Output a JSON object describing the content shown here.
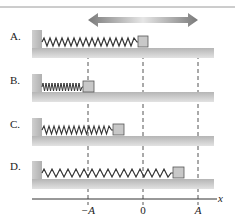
{
  "diagram": {
    "title_arrow": "double-headed-arrow",
    "rows": [
      {
        "label": "A.",
        "block_position": "0",
        "spring_state": "equilibrium"
      },
      {
        "label": "B.",
        "block_position": "-A",
        "spring_state": "compressed"
      },
      {
        "label": "C.",
        "block_position": "-A/2",
        "spring_state": "partially-compressed"
      },
      {
        "label": "D.",
        "block_position": "A/2",
        "spring_state": "stretched"
      }
    ],
    "axis": {
      "label": "x",
      "ticks": [
        "−A",
        "0",
        "A"
      ]
    },
    "colors": {
      "floor": "#bdbdbd",
      "wall": "#c4c4c4",
      "block": "#c8c8c8",
      "spring": "#333333",
      "arrow": "#8a8a8a",
      "dashed": "#555555"
    }
  }
}
